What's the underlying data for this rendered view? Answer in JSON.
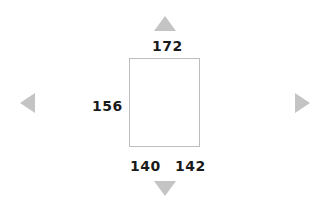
{
  "navigation": {
    "up_icon": "triangle-up",
    "down_icon": "triangle-down",
    "left_icon": "triangle-left",
    "right_icon": "triangle-right",
    "arrow_color": "#c4c4c4"
  },
  "shape": {
    "type": "rectangle",
    "border_color": "#bdbdbd",
    "labels": {
      "top": "172",
      "left": "156",
      "bottom_left": "140",
      "bottom_right": "142"
    }
  }
}
